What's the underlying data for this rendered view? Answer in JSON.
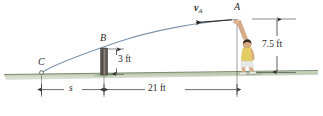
{
  "figure": {
    "points": {
      "a": "A",
      "b": "B",
      "c": "C"
    },
    "vector": {
      "symbol": "v",
      "subscript": "A"
    },
    "dimensions": {
      "height_person": "7.5 ft",
      "height_post": "3 ft",
      "distance_unknown": "s",
      "distance_known": "21 ft"
    },
    "colors": {
      "trajectory": "#7d96ae",
      "ground_top": "#c9d3bd",
      "ground_body": "#9aab8c",
      "post": "#5a5550",
      "dimension_line": "#3c3c3c",
      "shirt": "#e3cc62",
      "shorts": "#e8e8e4",
      "hair": "#3a2a1c",
      "skin": "#d8ab85",
      "label_text": "#2b2b2b"
    }
  }
}
